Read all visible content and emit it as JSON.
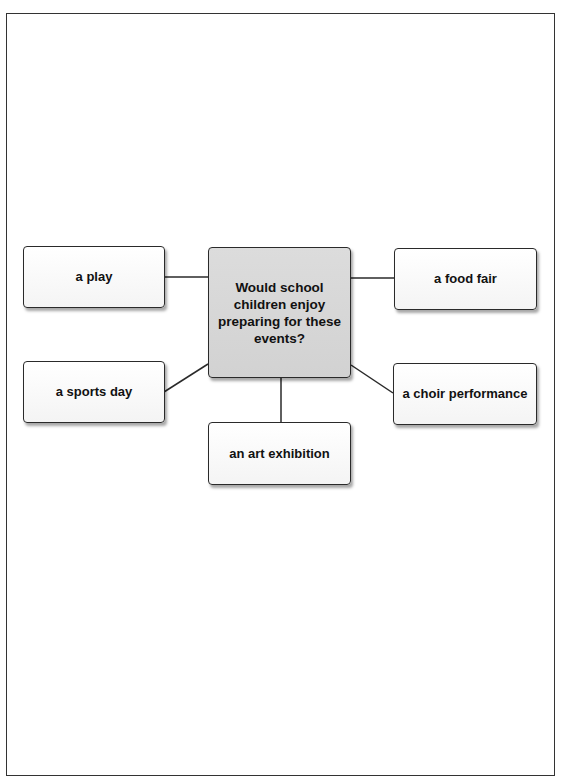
{
  "diagram": {
    "central_question": "Would school children enjoy preparing for these events?",
    "central_lines": [
      "Would school",
      "children enjoy",
      "preparing for these",
      "events?"
    ],
    "options": {
      "top_left": "a play",
      "top_right": "a food fair",
      "middle_left": "a sports day",
      "middle_right": "a choir performance",
      "bottom": "an art exhibition"
    },
    "colors": {
      "center_fill": "#d6d6d6",
      "option_fill": "#f8f8f8",
      "border": "#2a2a2a",
      "line": "#2a2a2a"
    }
  }
}
